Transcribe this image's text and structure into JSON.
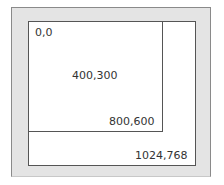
{
  "diagram": {
    "outer_frame": {
      "fill": "#e4e4e4",
      "border": "#8a8a8a"
    },
    "screen_rect": {
      "label": "1024,768",
      "border": "#555555"
    },
    "viewport_rect": {
      "label": "800,600",
      "border": "#555555"
    },
    "labels": {
      "origin": "0,0",
      "center": "400,300",
      "viewport_corner": "800,600",
      "screen_corner": "1024,768"
    }
  }
}
